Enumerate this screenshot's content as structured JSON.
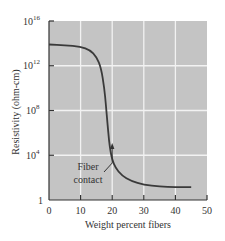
{
  "chart_data": {
    "type": "line",
    "title": "",
    "xlabel": "Weight percent fibers",
    "ylabel": "Resistivity (ohm-cm)",
    "xlim": [
      0,
      50
    ],
    "ylim_log10": [
      0,
      16
    ],
    "yscale": "log",
    "grid": true,
    "x_ticks": [
      "0",
      "10",
      "20",
      "30",
      "40",
      "50"
    ],
    "y_ticks": [
      {
        "base": "1",
        "exp": ""
      },
      {
        "base": "10",
        "exp": "4"
      },
      {
        "base": "10",
        "exp": "8"
      },
      {
        "base": "10",
        "exp": "12"
      },
      {
        "base": "10",
        "exp": "16"
      }
    ],
    "series": [
      {
        "name": "Resistivity",
        "x": [
          0,
          5,
          10,
          13,
          15,
          16.5,
          17.5,
          18,
          18.5,
          19,
          19.5,
          20,
          21,
          23,
          26,
          30,
          35,
          40,
          45
        ],
        "log10_y": [
          13.9,
          13.85,
          13.7,
          13.4,
          12.8,
          11.8,
          10.0,
          8.5,
          6.8,
          5.3,
          4.3,
          3.6,
          2.9,
          2.2,
          1.7,
          1.35,
          1.2,
          1.15,
          1.15
        ]
      }
    ],
    "annotations": [
      {
        "text_line1": "Fiber",
        "text_line2": "contact",
        "arrow_x": 20,
        "arrow_log10_y": 3.9
      }
    ]
  }
}
